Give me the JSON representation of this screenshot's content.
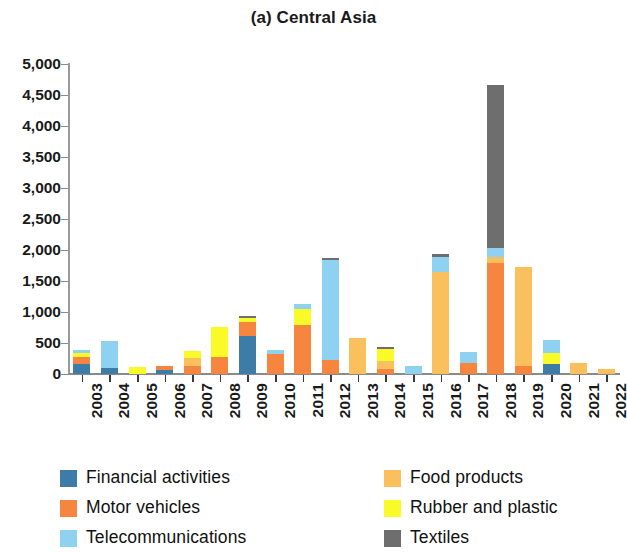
{
  "chart_data": {
    "type": "bar",
    "stacked": true,
    "title": "(a) Central Asia",
    "xlabel": "",
    "ylabel": "",
    "ylim": [
      0,
      5000
    ],
    "ytick_values": [
      0,
      500,
      1000,
      1500,
      2000,
      2500,
      3000,
      3500,
      4000,
      4500,
      5000
    ],
    "ytick_labels": [
      "0",
      "500",
      "1,000",
      "1,500",
      "2,000",
      "2,500",
      "3,000",
      "3,500",
      "4,000",
      "4,500",
      "5,000"
    ],
    "grid": false,
    "legend_position": "bottom",
    "categories": [
      "2003",
      "2004",
      "2005",
      "2006",
      "2007",
      "2008",
      "2009",
      "2010",
      "2011",
      "2012",
      "2013",
      "2014",
      "2015",
      "2016",
      "2017",
      "2018",
      "2019",
      "2020",
      "2021",
      "2022"
    ],
    "series": [
      {
        "name": "Financial activities",
        "color": "#3C7CA6",
        "values": [
          165,
          95,
          0,
          60,
          0,
          0,
          615,
          0,
          0,
          0,
          0,
          0,
          0,
          0,
          0,
          0,
          0,
          155,
          0,
          0
        ]
      },
      {
        "name": "Motor vehicles",
        "color": "#F5853F",
        "values": [
          105,
          0,
          0,
          70,
          130,
          275,
          225,
          330,
          790,
          230,
          0,
          85,
          0,
          0,
          175,
          1790,
          130,
          0,
          0,
          0
        ]
      },
      {
        "name": "Telecommunications",
        "color": "#8ED1F0",
        "values": [
          55,
          440,
          0,
          0,
          0,
          0,
          0,
          55,
          80,
          1610,
          0,
          0,
          130,
          250,
          175,
          145,
          0,
          210,
          0,
          0
        ]
      },
      {
        "name": "Food products",
        "color": "#FAC05E",
        "values": [
          0,
          0,
          0,
          0,
          130,
          0,
          0,
          0,
          0,
          0,
          580,
          125,
          0,
          1645,
          0,
          100,
          1600,
          0,
          170,
          85
        ]
      },
      {
        "name": "Rubber and plastic",
        "color": "#FAFA28",
        "values": [
          70,
          0,
          120,
          0,
          115,
          480,
          70,
          0,
          255,
          0,
          0,
          200,
          0,
          0,
          0,
          0,
          0,
          185,
          0,
          0
        ]
      },
      {
        "name": "Textiles",
        "color": "#6E6E6E",
        "values": [
          0,
          0,
          0,
          0,
          0,
          0,
          25,
          0,
          0,
          35,
          0,
          30,
          0,
          35,
          0,
          2620,
          0,
          0,
          0,
          0
        ]
      }
    ],
    "stack_order": [
      "Financial activities",
      "Motor vehicles",
      "Food products",
      "Rubber and plastic",
      "Telecommunications",
      "Textiles"
    ]
  },
  "legend": {
    "columns": [
      {
        "items": [
          {
            "label": "Financial activities",
            "color": "#3C7CA6",
            "swatch": "legend-swatch-financial-activities"
          },
          {
            "label": "Motor vehicles",
            "color": "#F5853F",
            "swatch": "legend-swatch-motor-vehicles"
          },
          {
            "label": "Telecommunications",
            "color": "#8ED1F0",
            "swatch": "legend-swatch-telecommunications"
          }
        ]
      },
      {
        "items": [
          {
            "label": "Food products",
            "color": "#FAC05E",
            "swatch": "legend-swatch-food-products"
          },
          {
            "label": "Rubber and plastic",
            "color": "#FAFA28",
            "swatch": "legend-swatch-rubber-and-plastic"
          },
          {
            "label": "Textiles",
            "color": "#6E6E6E",
            "swatch": "legend-swatch-textiles"
          }
        ]
      }
    ]
  }
}
